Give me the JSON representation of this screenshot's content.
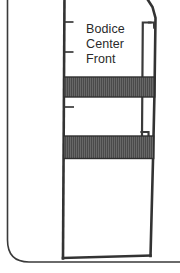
{
  "figure": {
    "kind": "sewing-pattern-diagram",
    "background_color": "#ffffff",
    "ink_color": "#333333",
    "band_fill_color": "#4a4a4a",
    "band_hatch_color": "#6e6e6e",
    "label": {
      "line1": "Bodice",
      "line2": "Center",
      "line3": "Front"
    },
    "parts": {
      "outer_frame_name": "garment-outline",
      "pattern_piece_name": "bodice-center-front-panel",
      "band_1_name": "trim-band-upper",
      "band_2_name": "trim-band-lower",
      "placket_name": "center-front-placket-strip",
      "notch_count": 3
    }
  }
}
